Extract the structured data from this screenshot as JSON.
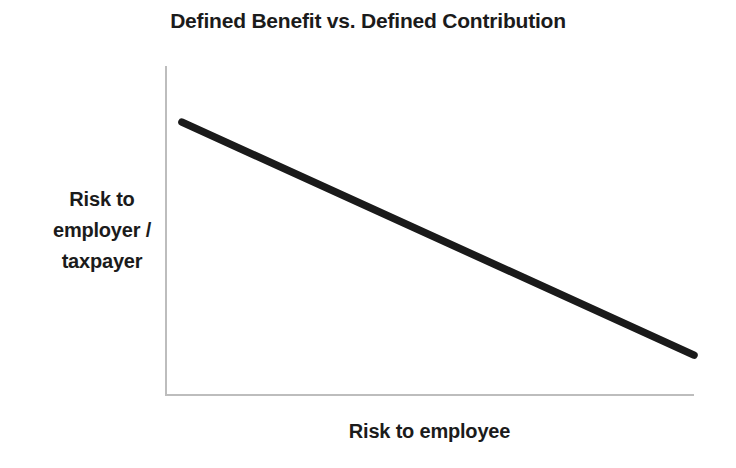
{
  "chart_data": {
    "type": "line",
    "title": "Defined Benefit vs. Defined Contribution",
    "xlabel": "Risk to employee",
    "ylabel": "Risk to employer / taxpayer",
    "ylabel_lines": [
      "Risk to",
      "employer /",
      "taxpayer"
    ],
    "grid": false,
    "legend": false,
    "legend_position": "none",
    "xlim": [
      0,
      1
    ],
    "ylim": [
      0,
      1
    ],
    "xticks": [],
    "yticks": [],
    "xticklabels": [],
    "yticklabels": [],
    "annotations": [],
    "series": [
      {
        "name": "Risk tradeoff",
        "x": [
          0.032,
          1.0
        ],
        "y": [
          0.83,
          0.124
        ],
        "points": [
          {
            "x": 0.032,
            "y": 0.83
          },
          {
            "x": 1.0,
            "y": 0.124
          }
        ],
        "color": "#1a1a1a",
        "linewidth": 7.5,
        "style": "solid",
        "markers": "none"
      }
    ],
    "colors": {
      "line": "#1a1a1a",
      "axis": "#bdbdbd",
      "text": "#1b1b1b",
      "background": "#ffffff"
    }
  }
}
